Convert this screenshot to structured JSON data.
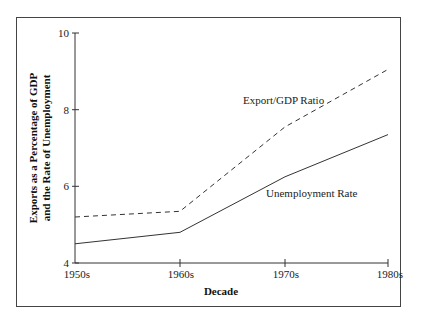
{
  "chart_data": {
    "type": "line",
    "title": "",
    "xlabel": "Decade",
    "ylabel": "Exports as a Percentage of GDP and the Rate of Unemployment",
    "ylabel_lines": [
      "Exports as a Percentage of GDP",
      "and the Rate of Unemployment"
    ],
    "categories": [
      "1950s",
      "1960s",
      "1970s",
      "1980s"
    ],
    "ylim": [
      4,
      10
    ],
    "yticks": [
      4,
      6,
      8,
      10
    ],
    "grid": false,
    "legend": "inline labels",
    "series": [
      {
        "name": "Export/GDP Ratio",
        "style": "dashed",
        "values": [
          5.2,
          5.35,
          7.55,
          9.05
        ]
      },
      {
        "name": "Unemployment Rate",
        "style": "solid",
        "values": [
          4.5,
          4.8,
          6.25,
          7.35
        ]
      }
    ]
  },
  "labels": {
    "export_series": "Export/GDP Ratio",
    "unemployment_series": "Unemployment Rate",
    "x_axis_title": "Decade",
    "y_axis_title_line1": "Exports as a Percentage of GDP",
    "y_axis_title_line2": "and the Rate of Unemployment",
    "ytick_10": "10",
    "ytick_8": "8",
    "ytick_6": "6",
    "ytick_4": "4",
    "xtick_0": "1950s",
    "xtick_1": "1960s",
    "xtick_2": "1970s",
    "xtick_3": "1980s"
  },
  "colors": {
    "line": "#333333",
    "frame": "#444444",
    "background": "#ffffff"
  }
}
